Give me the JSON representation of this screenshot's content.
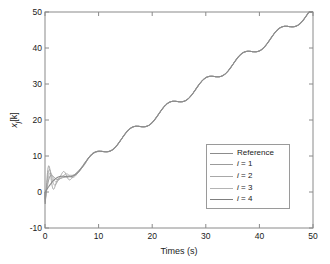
{
  "chart_data": {
    "type": "line",
    "title": "",
    "xlabel": "Times (s)",
    "ylabel": "x_j[k]",
    "ylabel_parts": {
      "base": "x",
      "sub": "j",
      "bracket": "[k]"
    },
    "xlim": [
      0,
      50
    ],
    "ylim": [
      -10,
      50
    ],
    "xticks": [
      0,
      10,
      20,
      30,
      40,
      50
    ],
    "yticks": [
      -10,
      0,
      10,
      20,
      30,
      40,
      50
    ],
    "xtick_labels": [
      "0",
      "10",
      "20",
      "30",
      "40",
      "50"
    ],
    "ytick_labels": [
      "-10",
      "0",
      "10",
      "20",
      "30",
      "40",
      "50"
    ],
    "grid": false,
    "box": true,
    "legend_position": "lower right",
    "legend_entries": [
      {
        "label": "Reference",
        "color": "#8c8c8c",
        "italic_prefix": ""
      },
      {
        "label": "= 1",
        "color": "#9b9b9b",
        "italic_prefix": "i "
      },
      {
        "label": "= 2",
        "color": "#a8a8a8",
        "italic_prefix": "i "
      },
      {
        "label": "= 3",
        "color": "#b4b4b4",
        "italic_prefix": "i "
      },
      {
        "label": "= 4",
        "color": "#7f7f7f",
        "italic_prefix": "i "
      }
    ],
    "series": [
      {
        "name": "Reference",
        "color": "#8c8c8c",
        "description": "ramp plus sinusoidal ripple, x(t) = t + 1.25*sin(0.9*t)",
        "x": [
          0,
          1,
          2,
          3,
          4,
          5,
          6,
          7,
          8,
          9,
          10,
          11,
          12,
          13,
          14,
          15,
          16,
          17,
          18,
          19,
          20,
          21,
          22,
          23,
          24,
          25,
          26,
          27,
          28,
          29,
          30,
          31,
          32,
          33,
          34,
          35,
          36,
          37,
          38,
          39,
          40,
          41,
          42,
          43,
          44,
          45,
          46,
          47,
          48,
          49,
          50
        ],
        "y": [
          0.0,
          1.98,
          3.52,
          4.06,
          4.0,
          4.24,
          5.29,
          7.0,
          8.76,
          9.98,
          10.49,
          10.53,
          10.62,
          11.3,
          12.73,
          14.6,
          16.4,
          17.7,
          18.3,
          18.5,
          18.8,
          19.7,
          21.3,
          23.2,
          24.9,
          26.1,
          26.6,
          26.7,
          26.9,
          27.5,
          28.8,
          30.7,
          32.6,
          34.1,
          34.8,
          35.0,
          35.2,
          36.0,
          37.4,
          39.2,
          41.0,
          42.4,
          43.0,
          43.1,
          43.3,
          44.0,
          45.3,
          47.1,
          48.9,
          50.0,
          50.0
        ]
      },
      {
        "name": "i = 1",
        "color": "#9b9b9b",
        "initial_transient_min": -3.2,
        "initial_overshoot": 5.2
      },
      {
        "name": "i = 2",
        "color": "#a8a8a8",
        "initial_transient_min": -2.4,
        "initial_overshoot": 4.7
      },
      {
        "name": "i = 3",
        "color": "#b4b4b4",
        "initial_transient_min": -1.6,
        "initial_overshoot": 4.2
      },
      {
        "name": "i = 4",
        "color": "#7f7f7f",
        "initial_transient_min": -0.8,
        "initial_overshoot": 3.8
      }
    ]
  },
  "axes": {
    "line_color": "#8a8a8a",
    "tick_color": "#8a8a8a",
    "background": "#ffffff"
  }
}
